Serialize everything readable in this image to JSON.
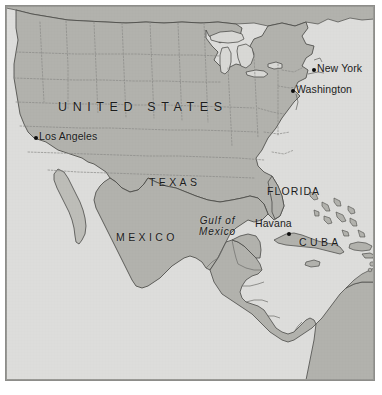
{
  "map": {
    "title": "North America and Caribbean reference map",
    "colors": {
      "ocean": "#dddddb",
      "land": "#b2b2ad",
      "land_secondary": "#bdbdb8",
      "lake": "#d8d8d5",
      "coastline": "#4a4a47",
      "internal_border": "#6f6f6b",
      "state_border": "#8a8a86",
      "frame": "#8d8d8a",
      "label_text": "#1c1c1c",
      "city_dot": "#0d0d0d",
      "page_background": "#ffffff"
    },
    "countries": [
      {
        "id": "united-states",
        "label": "UNITED STATES",
        "style": "major",
        "x": 54,
        "y": 95
      },
      {
        "id": "mexico",
        "label": "MEXICO",
        "style": "region-spaced",
        "x": 113,
        "y": 227
      },
      {
        "id": "cuba",
        "label": "CUBA",
        "style": "region-spaced",
        "x": 296,
        "y": 232
      }
    ],
    "regions": [
      {
        "id": "texas",
        "label": "TEXAS",
        "style": "region-spaced",
        "x": 146,
        "y": 172
      },
      {
        "id": "florida",
        "label": "FLORIDA",
        "style": "region",
        "x": 264,
        "y": 181
      }
    ],
    "water_labels": [
      {
        "id": "gulf-of-mexico",
        "line1": "Gulf of",
        "line2": "Mexico",
        "x": 196,
        "y": 211
      }
    ],
    "cities": [
      {
        "id": "new-york",
        "label": "New York",
        "dot_x": 313,
        "dot_y": 70,
        "label_x": 318,
        "label_y": 64
      },
      {
        "id": "washington",
        "label": "Washington",
        "dot_x": 292,
        "dot_y": 91,
        "label_x": 297,
        "label_y": 85
      },
      {
        "id": "los-angeles",
        "label": "Los Angeles",
        "dot_x": 35,
        "dot_y": 138,
        "label_x": 40,
        "label_y": 132
      },
      {
        "id": "havana",
        "label": "Havana",
        "dot_x": 288,
        "dot_y": 234,
        "label_x": 256,
        "label_y": 220
      }
    ]
  }
}
